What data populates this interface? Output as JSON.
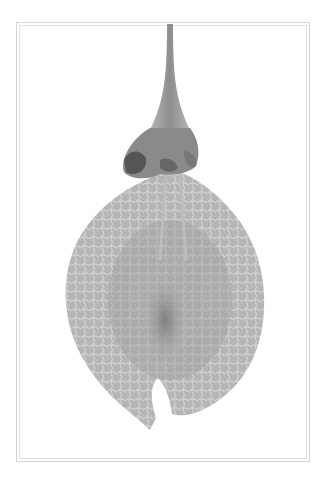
{
  "image": {
    "subject": "pressed seed pod specimen with stem, calyx and veined papery wing",
    "background": "#ffffff",
    "frame_color": "#d4d4d4",
    "specimen_colors": {
      "stem": "#9a9a9a",
      "calyx_dark": "#5a5a5a",
      "wing": "#a8a8a8",
      "wing_light": "#c2c2c2",
      "seed_core": "#7c7c7c"
    }
  }
}
